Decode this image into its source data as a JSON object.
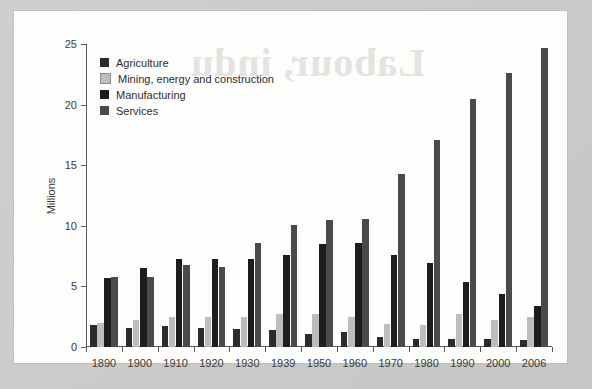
{
  "watermark_text": "Labour, indu",
  "chart_data": {
    "type": "bar",
    "title": "",
    "xlabel": "",
    "ylabel": "Millions",
    "ylim": [
      0,
      25
    ],
    "yticks": [
      0,
      5,
      10,
      15,
      20,
      25
    ],
    "grid": false,
    "legend_position": "top-left",
    "categories": [
      "1890",
      "1900",
      "1910",
      "1920",
      "1930",
      "1939",
      "1950",
      "1960",
      "1970",
      "1980",
      "1990",
      "2000",
      "2006"
    ],
    "series": [
      {
        "name": "Agriculture",
        "color": "#2b2b2b",
        "values": [
          1.8,
          1.6,
          1.7,
          1.6,
          1.5,
          1.4,
          1.1,
          1.2,
          0.8,
          0.65,
          0.65,
          0.65,
          0.55
        ]
      },
      {
        "name": "Mining, energy and construction",
        "color": "#bdbdbd",
        "values": [
          2.0,
          2.2,
          2.5,
          2.5,
          2.5,
          2.7,
          2.7,
          2.5,
          1.9,
          1.8,
          2.7,
          2.2,
          2.5
        ]
      },
      {
        "name": "Manufacturing",
        "color": "#1d1d1d",
        "values": [
          5.7,
          6.5,
          7.3,
          7.3,
          7.3,
          7.6,
          8.5,
          8.6,
          7.6,
          6.9,
          5.4,
          4.4,
          3.4
        ]
      },
      {
        "name": "Services",
        "color": "#4a4a4a",
        "values": [
          5.8,
          5.8,
          6.8,
          6.6,
          8.6,
          10.1,
          10.5,
          10.6,
          14.3,
          17.1,
          20.5,
          22.6,
          24.7
        ]
      }
    ]
  }
}
